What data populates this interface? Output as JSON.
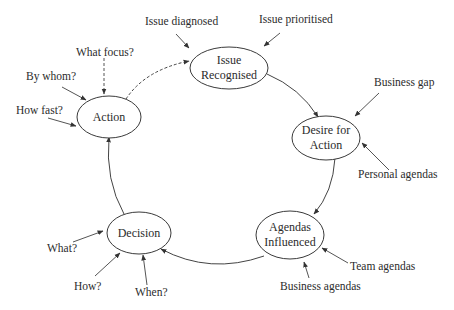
{
  "diagram": {
    "type": "cycle",
    "nodes": [
      {
        "id": "issue",
        "line1": "Issue",
        "line2": "Recognised"
      },
      {
        "id": "desire",
        "line1": "Desire for",
        "line2": "Action"
      },
      {
        "id": "agendas",
        "line1": "Agendas",
        "line2": "Influenced"
      },
      {
        "id": "decision",
        "line1": "Decision"
      },
      {
        "id": "action",
        "line1": "Action"
      }
    ],
    "edges": [
      {
        "from": "issue",
        "to": "desire",
        "style": "solid"
      },
      {
        "from": "desire",
        "to": "agendas",
        "style": "solid"
      },
      {
        "from": "agendas",
        "to": "decision",
        "style": "solid"
      },
      {
        "from": "decision",
        "to": "action",
        "style": "solid"
      },
      {
        "from": "action",
        "to": "issue",
        "style": "dashed"
      }
    ],
    "inputs": {
      "issue": [
        "Issue diagnosed",
        "Issue prioritised"
      ],
      "desire": [
        "Business gap",
        "Personal agendas"
      ],
      "agendas": [
        "Team agendas",
        "Business agendas"
      ],
      "decision": [
        "What?",
        "How?",
        "When?"
      ],
      "action": [
        "What focus?",
        "By whom?",
        "How fast?"
      ]
    }
  }
}
